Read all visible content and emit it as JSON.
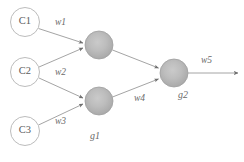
{
  "diagram": {
    "colors": {
      "background": "#ffffff",
      "input_node_stroke": "#b9b9b9",
      "input_node_fill": "#ffffff",
      "hidden_node_fill_center": "#c2c2c2",
      "hidden_node_fill_edge": "#a6a6a6",
      "hidden_node_stroke": "#a0a0a0",
      "edge_stroke": "#9a9a9a",
      "arrowhead_fill": "#6e6e6e",
      "text": "#5b5b5b"
    },
    "input_nodes": [
      {
        "id": "c1",
        "label": "C1",
        "cx": 25,
        "cy": 22,
        "r": 14.5
      },
      {
        "id": "c2",
        "label": "C2",
        "cx": 25,
        "cy": 72,
        "r": 14.5
      },
      {
        "id": "c3",
        "label": "C3",
        "cx": 25,
        "cy": 131,
        "r": 14.5
      }
    ],
    "hidden_nodes": [
      {
        "id": "h1",
        "label": "",
        "cx": 99,
        "cy": 45,
        "r": 14
      },
      {
        "id": "h2",
        "label": "",
        "cx": 99,
        "cy": 101,
        "r": 14
      }
    ],
    "output_nodes": [
      {
        "id": "g2node",
        "label": "",
        "cx": 174,
        "cy": 73,
        "r": 14
      }
    ],
    "edges": [
      {
        "id": "e1",
        "from": "c1",
        "to": "h1",
        "label": "w1",
        "label_x": 55,
        "label_y": 18
      },
      {
        "id": "e2",
        "from": "c2",
        "to": "h1",
        "label": "w2",
        "label_x": 55,
        "label_y": 68
      },
      {
        "id": "e3",
        "from": "c2",
        "to": "h2",
        "label": "",
        "label_x": 0,
        "label_y": 0
      },
      {
        "id": "e4",
        "from": "c3",
        "to": "h2",
        "label": "w3",
        "label_x": 55,
        "label_y": 117
      },
      {
        "id": "e5",
        "from": "h1",
        "to": "g2node",
        "label": "",
        "label_x": 0,
        "label_y": 0
      },
      {
        "id": "e6",
        "from": "h2",
        "to": "g2node",
        "label": "w4",
        "label_x": 134,
        "label_y": 94
      },
      {
        "id": "e7",
        "from": "g2node",
        "to": "out",
        "label": "w5",
        "label_x": 201,
        "label_y": 56
      }
    ],
    "group_labels": [
      {
        "id": "g1",
        "label": "g1",
        "x": 90,
        "y": 131
      },
      {
        "id": "g2",
        "label": "g2",
        "x": 178,
        "y": 90
      }
    ]
  }
}
